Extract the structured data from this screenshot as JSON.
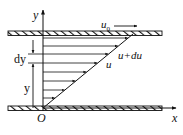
{
  "diagram": {
    "labels": {
      "y_axis": "y",
      "x_axis": "x",
      "origin": "O",
      "top_plate_velocity": "u",
      "top_plate_velocity_sub": "0",
      "velocity_u": "u",
      "velocity_u_du": "u+du",
      "dy": "dy",
      "y_height": "y"
    },
    "colors": {
      "line": "#111111",
      "background": "#ffffff"
    },
    "profile": {
      "type": "linear",
      "arrow_y_positions": [
        38,
        46,
        54,
        63,
        72,
        81,
        90,
        98
      ],
      "origin": [
        43,
        108
      ],
      "top": [
        133,
        34
      ]
    }
  }
}
